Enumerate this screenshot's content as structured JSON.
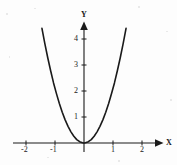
{
  "figure": {
    "background_color": "#fdfdfd",
    "ink_color": "#1a1a1a",
    "width": 177,
    "height": 165
  },
  "axes": {
    "x_axis_name": "X",
    "y_axis_name": "Y",
    "origin_label": "",
    "x_ticks": [
      {
        "value": -2,
        "label": "-2"
      },
      {
        "value": -1,
        "label": "-1"
      },
      {
        "value": 1,
        "label": "1"
      },
      {
        "value": 2,
        "label": "2"
      }
    ],
    "y_ticks": [
      {
        "value": 1,
        "label": "1"
      },
      {
        "value": 2,
        "label": "2"
      },
      {
        "value": 3,
        "label": "3"
      },
      {
        "value": 4,
        "label": "4"
      }
    ]
  },
  "chart_data": {
    "type": "line",
    "title": "",
    "subtitle": "",
    "xlabel": "X",
    "ylabel": "Y",
    "grid": false,
    "legend": [],
    "legend_position": "none",
    "xlim": [
      -2.55,
      2.55
    ],
    "ylim": [
      -0.5,
      5.2
    ],
    "xticks": [
      -2,
      -1,
      1,
      2
    ],
    "yticks": [
      1,
      2,
      3,
      4
    ],
    "annotations": [],
    "series": [
      {
        "name": "parabola",
        "equation": "y = 2x^2",
        "color": "#1a1a1a",
        "line_width": 1.6,
        "x": [
          -1.45,
          -1.35,
          -1.25,
          -1.15,
          -1.05,
          -0.95,
          -0.85,
          -0.75,
          -0.65,
          -0.55,
          -0.45,
          -0.35,
          -0.25,
          -0.15,
          -0.05,
          0,
          0.05,
          0.15,
          0.25,
          0.35,
          0.45,
          0.55,
          0.65,
          0.75,
          0.85,
          0.95,
          1.05,
          1.15,
          1.25,
          1.35,
          1.45
        ],
        "values": [
          4.41,
          3.82,
          3.28,
          2.78,
          2.31,
          1.9,
          1.52,
          1.18,
          0.89,
          0.64,
          0.43,
          0.26,
          0.13,
          0.05,
          0.01,
          0,
          0.01,
          0.05,
          0.13,
          0.26,
          0.43,
          0.64,
          0.89,
          1.18,
          1.52,
          1.9,
          2.31,
          2.78,
          3.28,
          3.82,
          4.41
        ]
      }
    ]
  }
}
